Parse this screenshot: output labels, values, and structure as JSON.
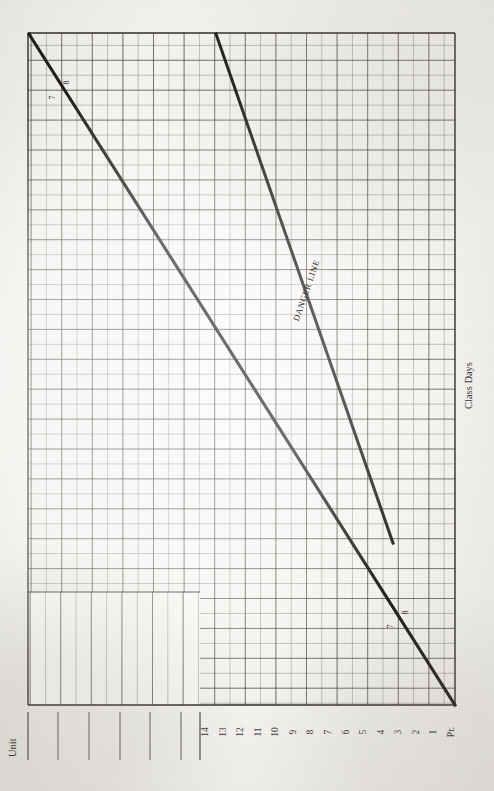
{
  "document": {
    "type": "progress-chart",
    "orientation": "landscape-rotated-90",
    "paper_color": "#f4f3f0",
    "ink_color": "#2e2b27"
  },
  "axes": {
    "y_axis_title": "Unit",
    "x_axis_title": "Class Days",
    "x_tick_labels": [
      "14",
      "13",
      "12",
      "11",
      "10",
      "9",
      "8",
      "7",
      "6",
      "5",
      "4",
      "3",
      "2",
      "1",
      "Pr."
    ]
  },
  "annotations": {
    "danger_line_label": "DANGER LINE",
    "marks": [
      {
        "label": "8",
        "position": "upper-left-line"
      },
      {
        "label": "7",
        "position": "upper-left-line"
      },
      {
        "label": "8",
        "position": "lower-right-line"
      },
      {
        "label": "7",
        "position": "lower-right-line"
      }
    ]
  },
  "chart_data": {
    "type": "line",
    "title": "",
    "subtitle": "",
    "xlabel": "Class Days",
    "ylabel": "Unit",
    "grid": true,
    "legend": "none",
    "xtick_labels": [
      "14",
      "13",
      "12",
      "11",
      "10",
      "9",
      "8",
      "7",
      "6",
      "5",
      "4",
      "3",
      "2",
      "1",
      "Pr."
    ],
    "xlim": [
      14,
      0
    ],
    "ylim": [
      0,
      15
    ],
    "series": [
      {
        "name": "Progress Line",
        "points": [
          [
            14,
            15
          ],
          [
            0,
            0
          ]
        ],
        "style": "solid-heavy",
        "color": "#201e1b"
      },
      {
        "name": "DANGER LINE",
        "points": [
          [
            8.7,
            15
          ],
          [
            2.8,
            3.1
          ]
        ],
        "style": "solid-heavy",
        "color": "#201e1b"
      }
    ]
  }
}
